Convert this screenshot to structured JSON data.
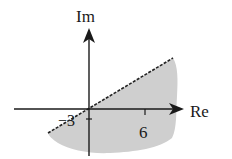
{
  "diagram": {
    "type": "complex-plane-region",
    "axes": {
      "imag_label": "Im",
      "real_label": "Re"
    },
    "ticks": {
      "real_positive": "6",
      "imag_negative": "−3"
    },
    "boundary": {
      "style": "dashed",
      "description": "line through origin; shaded region below it"
    },
    "colors": {
      "region_fill": "#cfcfcf",
      "axis": "#1a1a1a",
      "boundary": "#222222"
    }
  }
}
